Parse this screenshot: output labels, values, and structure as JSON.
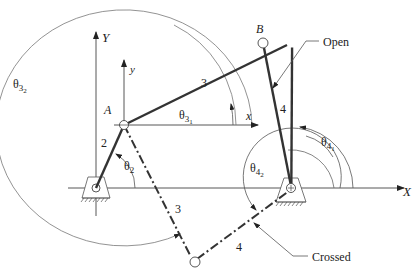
{
  "axes": {
    "global_x": "X",
    "global_y": "Y",
    "local_x": "x",
    "local_y": "y"
  },
  "points": {
    "A": "A",
    "B": "B"
  },
  "links": {
    "crank": "2",
    "coupler_open": "3",
    "rocker_open": "4",
    "coupler_crossed": "3",
    "rocker_crossed": "4"
  },
  "angles": {
    "theta2": {
      "base": "θ",
      "sub": "2"
    },
    "theta3_1": {
      "base": "θ",
      "sub": "3",
      "subsub": "1"
    },
    "theta3_2": {
      "base": "θ",
      "sub": "3",
      "subsub": "2"
    },
    "theta4_1": {
      "base": "θ",
      "sub": "4",
      "subsub": "1"
    },
    "theta4_2": {
      "base": "θ",
      "sub": "4",
      "subsub": "2"
    }
  },
  "callouts": {
    "open": "Open",
    "crossed": "Crossed"
  },
  "colors": {
    "link": "#333333",
    "thin": "#555555",
    "text": "#222222"
  }
}
